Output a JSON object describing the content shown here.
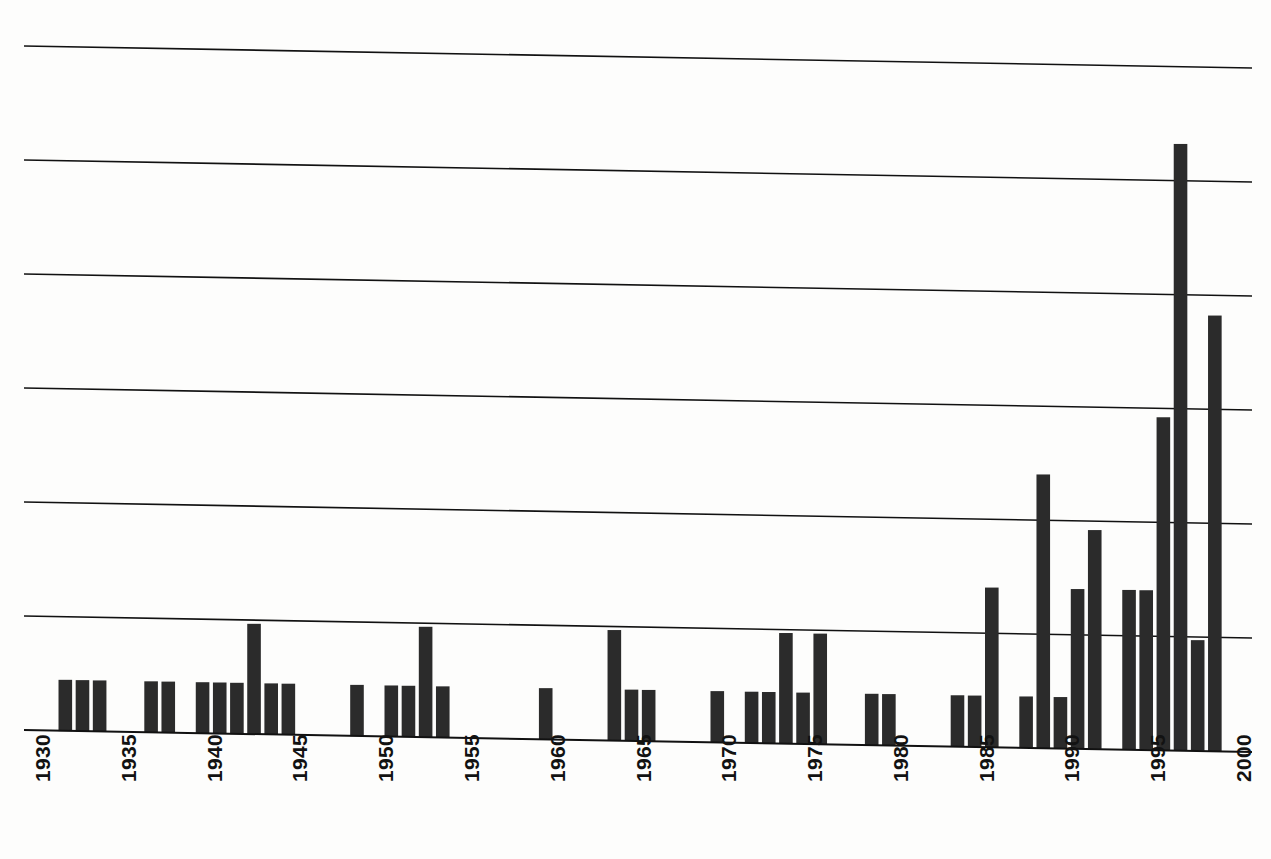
{
  "chart_data": {
    "type": "bar",
    "title": "",
    "subtitle": "",
    "xlabel": "",
    "ylabel": "",
    "xlim": [
      1930,
      2000
    ],
    "ylim": [
      0,
      6
    ],
    "grid": true,
    "gridlines": [
      1,
      2,
      3,
      4,
      5,
      6
    ],
    "legend": null,
    "bar_color": "#2b2b2b",
    "axis_color": "#111111",
    "background_color": "#fdfdfc",
    "tick_labels": [
      "1930",
      "1935",
      "1940",
      "1945",
      "1950",
      "1955",
      "1960",
      "1965",
      "1970",
      "1975",
      "1980",
      "1985",
      "1990",
      "1995",
      "2000"
    ],
    "tick_values": [
      1930,
      1935,
      1940,
      1945,
      1950,
      1955,
      1960,
      1965,
      1970,
      1975,
      1980,
      1985,
      1990,
      1995,
      2000
    ],
    "categories": [
      1932,
      1933,
      1934,
      1937,
      1938,
      1940,
      1941,
      1942,
      1943,
      1944,
      1945,
      1949,
      1951,
      1952,
      1953,
      1954,
      1960,
      1964,
      1965,
      1966,
      1970,
      1972,
      1973,
      1974,
      1975,
      1976,
      1979,
      1980,
      1984,
      1985,
      1986,
      1988,
      1989,
      1990,
      1991,
      1992,
      1994,
      1995,
      1996,
      1997,
      1998,
      1999
    ],
    "values": [
      0.45,
      0.45,
      0.45,
      0.45,
      0.45,
      0.45,
      0.45,
      0.45,
      0.97,
      0.45,
      0.45,
      0.45,
      0.45,
      0.45,
      0.97,
      0.45,
      0.45,
      0.97,
      0.45,
      0.45,
      0.45,
      0.45,
      0.45,
      0.97,
      0.45,
      0.97,
      0.45,
      0.45,
      0.45,
      0.45,
      1.4,
      0.45,
      2.4,
      0.45,
      1.4,
      1.92,
      1.4,
      1.4,
      2.92,
      5.32,
      0.97,
      3.82
    ],
    "series_name": "count"
  },
  "axis": {
    "x_axis_name": "year-axis",
    "y_axis_name": "value-axis"
  }
}
